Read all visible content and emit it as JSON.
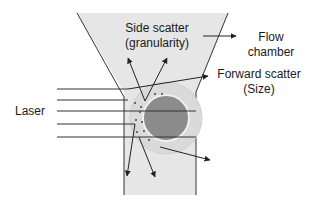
{
  "diagram": {
    "labels": {
      "side_scatter_line1": "Side scatter",
      "side_scatter_line2": "(granularity)",
      "flow_chamber_line1": "Flow",
      "flow_chamber_line2": "chamber",
      "forward_scatter_line1": "Forward scatter",
      "forward_scatter_line2": "(Size)",
      "laser": "Laser"
    },
    "colors": {
      "chamber_fill": "#e6e6e6",
      "cell_outer": "#d9d9d9",
      "cell_nucleus": "#8c8c8c",
      "line": "#222222"
    }
  }
}
